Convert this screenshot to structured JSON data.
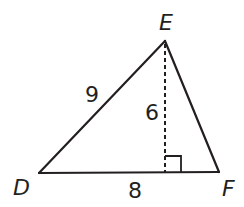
{
  "figure": {
    "type": "triangle",
    "vertices": [
      {
        "name": "D",
        "x": 39,
        "y": 173
      },
      {
        "name": "E",
        "x": 165,
        "y": 41
      },
      {
        "name": "F",
        "x": 219,
        "y": 172
      }
    ],
    "side_labels": {
      "DE": "9",
      "DF": "8",
      "altitude": "6"
    },
    "altitude": {
      "from": "E",
      "to_side": "DF",
      "style": "dashed",
      "right_angle_marker": true
    },
    "colors": {
      "stroke": "#231f20",
      "background": "#ffffff"
    }
  }
}
